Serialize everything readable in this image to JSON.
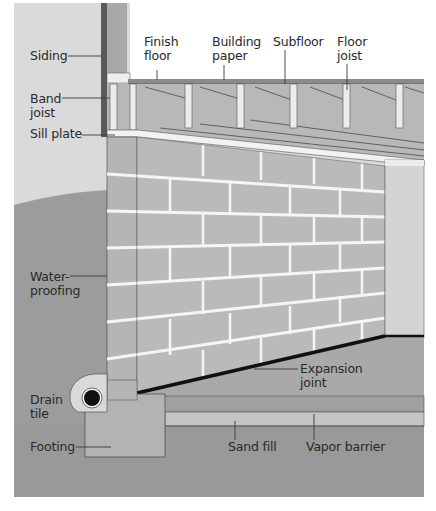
{
  "colors": {
    "background": "#ffffff",
    "sky": "#d9d9d9",
    "soil": "#9e9e9e",
    "soil_deep": "#8f8f8f",
    "block": "#b9b9b9",
    "mortar": "#f4f4f4",
    "interior_wall": "#d2d2d2",
    "slab": "#a8a8a8",
    "joist": "#e6e6e6",
    "line": "#3a3a3a",
    "drain": "#111111"
  },
  "labels": {
    "siding": "Siding",
    "band_joist": "Band\njoist",
    "sill_plate": "Sill plate",
    "finish_floor": "Finish\nfloor",
    "building_paper": "Building\npaper",
    "subfloor": "Subfloor",
    "floor_joist": "Floor\njoist",
    "waterproofing": "Water-\nproofing",
    "drain_tile": "Drain\ntile",
    "footing": "Footing",
    "expansion_joint": "Expansion\njoint",
    "sand_fill": "Sand fill",
    "vapor_barrier": "Vapor barrier"
  }
}
